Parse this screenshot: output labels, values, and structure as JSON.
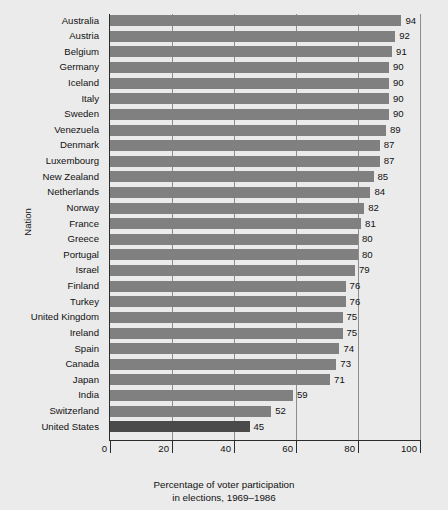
{
  "chart_data": {
    "type": "bar",
    "orientation": "horizontal",
    "title": "",
    "xlabel_line1": "Percentage of voter participation",
    "xlabel_line2": "in elections, 1969–1986",
    "ylabel": "Nation",
    "xlim": [
      0,
      100
    ],
    "xticks": [
      "0",
      "20",
      "40",
      "60",
      "80",
      "100"
    ],
    "xtick_values": [
      0,
      20,
      40,
      60,
      80,
      100
    ],
    "grid": "vertical gridlines at 20, 40, 60, 80, 100",
    "legend": "none",
    "bar_color": "#808080",
    "highlight_color": "#4a4a4a",
    "highlight_category": "United States",
    "background_color": "#ebebeb",
    "categories": [
      "Australia",
      "Austria",
      "Belgium",
      "Germany",
      "Iceland",
      "Italy",
      "Sweden",
      "Venezuela",
      "Denmark",
      "Luxembourg",
      "New Zealand",
      "Netherlands",
      "Norway",
      "France",
      "Greece",
      "Portugal",
      "Israel",
      "Finland",
      "Turkey",
      "United Kingdom",
      "Ireland",
      "Spain",
      "Canada",
      "Japan",
      "India",
      "Switzerland",
      "United States"
    ],
    "values": [
      94,
      92,
      91,
      90,
      90,
      90,
      90,
      89,
      87,
      87,
      85,
      84,
      82,
      81,
      80,
      80,
      79,
      76,
      76,
      75,
      75,
      74,
      73,
      71,
      59,
      52,
      45
    ]
  }
}
